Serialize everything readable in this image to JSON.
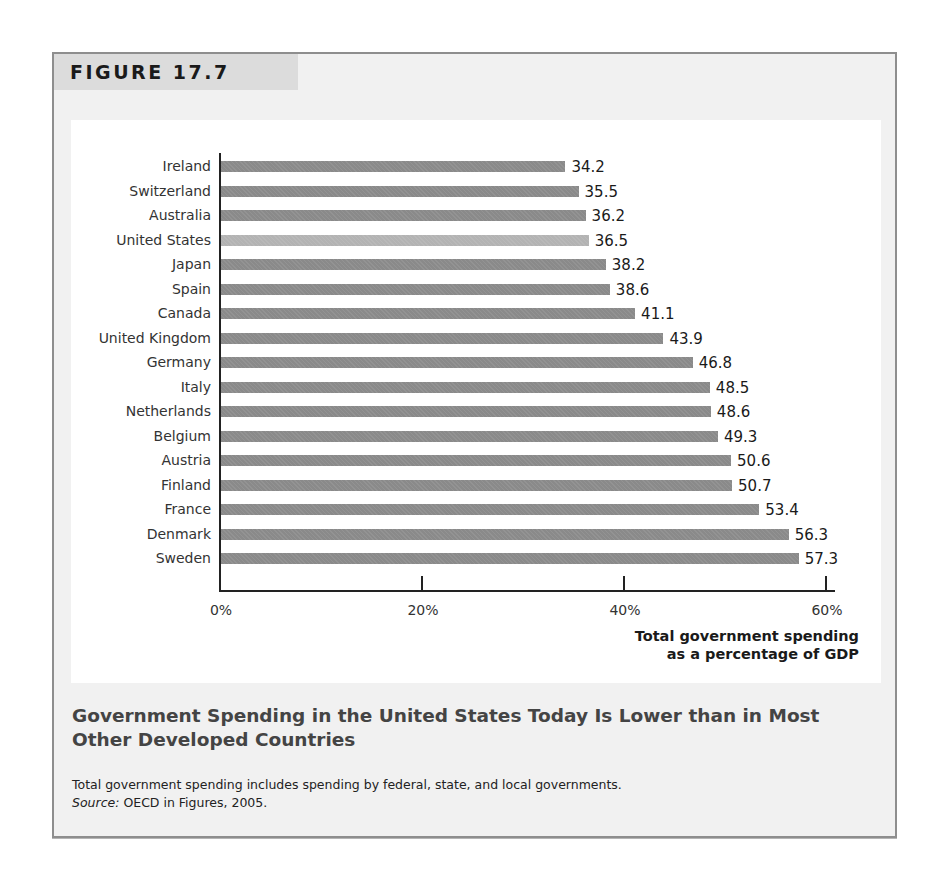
{
  "figure": {
    "label": "FIGURE 17.7",
    "title": "Government Spending in the United States Today Is Lower than in Most Other Developed Countries",
    "note": "Total government spending includes spending by federal, state, and local governments.",
    "source_label": "Source:",
    "source_text": " OECD in Figures, 2005."
  },
  "colors": {
    "bar": "#8a8a8a",
    "highlight_bar": "#b3b3b3",
    "panel_bg": "#f1f1f1",
    "chart_bg": "#ffffff"
  },
  "chart_data": {
    "type": "bar",
    "orientation": "horizontal",
    "title": "Government Spending in the United States Today Is Lower than in Most Other Developed Countries",
    "xlabel": "Total government spending as a percentage of GDP",
    "ylabel": "",
    "xlim": [
      0,
      60
    ],
    "x_ticks": [
      "0%",
      "20%",
      "40%",
      "60%"
    ],
    "grid": false,
    "legend": null,
    "highlight": "United States",
    "categories": [
      "Ireland",
      "Switzerland",
      "Australia",
      "United States",
      "Japan",
      "Spain",
      "Canada",
      "United Kingdom",
      "Germany",
      "Italy",
      "Netherlands",
      "Belgium",
      "Austria",
      "Finland",
      "France",
      "Denmark",
      "Sweden"
    ],
    "values": [
      34.2,
      35.5,
      36.2,
      36.5,
      38.2,
      38.6,
      41.1,
      43.9,
      46.8,
      48.5,
      48.6,
      49.3,
      50.6,
      50.7,
      53.4,
      56.3,
      57.3
    ],
    "value_labels": [
      "34.2",
      "35.5",
      "36.2",
      "36.5",
      "38.2",
      "38.6",
      "41.1",
      "43.9",
      "46.8",
      "48.5",
      "48.6",
      "49.3",
      "50.6",
      "50.7",
      "53.4",
      "56.3",
      "57.3"
    ],
    "axis_title_lines": [
      "Total government spending",
      "as a percentage of GDP"
    ]
  }
}
